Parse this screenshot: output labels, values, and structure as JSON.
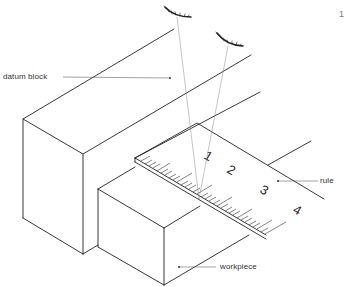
{
  "diagram": {
    "type": "technical-illustration",
    "labels": {
      "datum_block": "datum block",
      "rule": "rule",
      "workpiece": "workpiece"
    },
    "rule_scale_numbers": [
      "1",
      "2",
      "3",
      "4"
    ],
    "figure_mark": "1",
    "eyes": [
      {
        "name": "eye-position-1",
        "note": "viewing from above left"
      },
      {
        "name": "eye-position-2",
        "note": "viewing from above right"
      }
    ],
    "colors": {
      "line": "#222222",
      "sight_line": "#8a8a8a",
      "label": "#333333",
      "background": "#ffffff"
    }
  }
}
